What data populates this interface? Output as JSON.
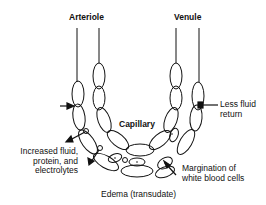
{
  "diagram": {
    "type": "anatomical-flow",
    "labels": {
      "arteriole": "Arteriole",
      "venule": "Venule",
      "capillary": "Capillary",
      "less_fluid_line1": "Less fluid",
      "less_fluid_line2": "return",
      "increased_line1": "Increased fluid,",
      "increased_line2": "protein, and",
      "increased_line3": "electrolytes",
      "margination_line1": "Margination of",
      "margination_line2": "white blood cells",
      "edema": "Edema (transudate)"
    },
    "colors": {
      "stroke": "#111111",
      "background": "#ffffff"
    }
  }
}
